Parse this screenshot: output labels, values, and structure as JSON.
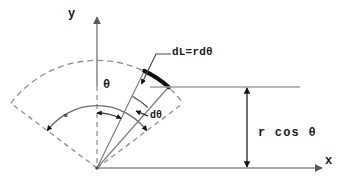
{
  "figure": {
    "type": "geometry-diagram",
    "background_color": "#ffffff",
    "line_color": "#808080",
    "accent_color": "#000000",
    "text_color": "#1a1a1a"
  },
  "axes": {
    "y_label": "y",
    "x_label": "x",
    "origin_label": ""
  },
  "labels": {
    "arc_element": "dL=rdθ",
    "height": "r cos θ",
    "angle_theta": "θ",
    "angle_dtheta": "dθ",
    "angle_alpha": "∝"
  },
  "geometry": {
    "origin": {
      "x": 97,
      "y": 168
    },
    "radius_outer": 108,
    "radius_inner": 62,
    "theta_deg": 26,
    "dtheta_deg": 15,
    "alpha_half_deg": 53,
    "height_value_label": "r cos θ",
    "reference_line_y": 87,
    "dimension_arrow_x": 247
  }
}
